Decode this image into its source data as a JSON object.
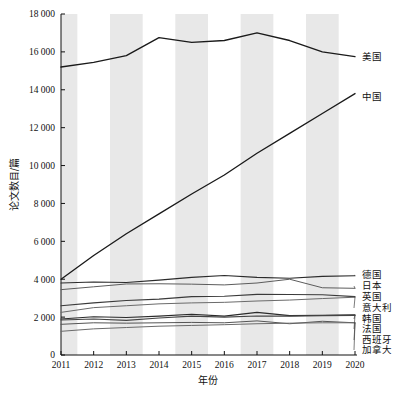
{
  "chart_data": {
    "type": "line",
    "title": "",
    "xlabel": "年份",
    "ylabel": "论文数目/篇",
    "x": [
      2011,
      2012,
      2013,
      2014,
      2015,
      2016,
      2017,
      2018,
      2019,
      2020
    ],
    "xtick_labels": [
      "2011",
      "2012",
      "2013",
      "2014",
      "2015",
      "2016",
      "2017",
      "2018",
      "2019",
      "2020"
    ],
    "ytick_labels": [
      "0",
      "2 000",
      "4 000",
      "6 000",
      "8 000",
      "10 000",
      "12 000",
      "14 000",
      "16 000",
      "18 000"
    ],
    "ytick_values": [
      0,
      2000,
      4000,
      6000,
      8000,
      10000,
      12000,
      14000,
      16000,
      18000
    ],
    "ylim": [
      0,
      18000
    ],
    "xlim": [
      2011,
      2020
    ],
    "grid": false,
    "legend_position": "right-inline",
    "shaded_bands": [
      2011,
      2013,
      2015,
      2017,
      2019
    ],
    "series": [
      {
        "name": "美国",
        "color": "#1a1a1a",
        "width": 1.35,
        "values": [
          15200,
          15450,
          15800,
          16750,
          16500,
          16600,
          17000,
          16600,
          16000,
          15750
        ]
      },
      {
        "name": "中国",
        "color": "#1a1a1a",
        "width": 1.35,
        "values": [
          4000,
          5250,
          6400,
          7450,
          8500,
          9500,
          10650,
          11700,
          12750,
          13800
        ]
      },
      {
        "name": "德国",
        "color": "#2b2b2b",
        "width": 1.1,
        "values": [
          3800,
          3850,
          3830,
          3950,
          4100,
          4200,
          4100,
          4050,
          4150,
          4180
        ]
      },
      {
        "name": "日本",
        "color": "#5c5c5c",
        "width": 1.0,
        "values": [
          3450,
          3600,
          3750,
          3760,
          3740,
          3700,
          3800,
          4000,
          3550,
          3520
        ]
      },
      {
        "name": "英国",
        "color": "#3a3a3a",
        "width": 1.1,
        "values": [
          2600,
          2750,
          2880,
          2950,
          3080,
          3100,
          3200,
          3190,
          3180,
          3080
        ]
      },
      {
        "name": "意大利",
        "color": "#6b6b6b",
        "width": 1.0,
        "values": [
          2250,
          2500,
          2600,
          2700,
          2750,
          2780,
          2850,
          2900,
          2980,
          3050
        ]
      },
      {
        "name": "韩国",
        "color": "#2b2b2b",
        "width": 1.1,
        "values": [
          1900,
          2020,
          1980,
          2050,
          2150,
          2050,
          2250,
          2080,
          2100,
          2120
        ]
      },
      {
        "name": "法国",
        "color": "#444444",
        "width": 1.1,
        "values": [
          1850,
          1900,
          1830,
          1950,
          2050,
          2000,
          2060,
          2050,
          2080,
          2090
        ]
      },
      {
        "name": "西班牙",
        "color": "#555555",
        "width": 1.0,
        "values": [
          1620,
          1700,
          1680,
          1700,
          1720,
          1700,
          1800,
          1650,
          1780,
          1700
        ]
      },
      {
        "name": "加拿大",
        "color": "#6b6b6b",
        "width": 1.0,
        "values": [
          1250,
          1380,
          1450,
          1520,
          1560,
          1600,
          1650,
          1680,
          1700,
          1700
        ]
      }
    ],
    "annotations": [
      {
        "label": "美国",
        "anchor_x": 2020,
        "anchor_y": 15750
      },
      {
        "label": "中国",
        "anchor_x": 2020,
        "anchor_y": 13800
      },
      {
        "label": "德国",
        "anchor_x": 2020,
        "anchor_y": 4180
      },
      {
        "label": "日本",
        "anchor_x": 2020,
        "anchor_y": 3520
      },
      {
        "label": "英国",
        "anchor_x": 2020,
        "anchor_y": 3080
      },
      {
        "label": "意大利",
        "anchor_x": 2020,
        "anchor_y": 3050
      },
      {
        "label": "韩国",
        "anchor_x": 2020,
        "anchor_y": 2120
      },
      {
        "label": "法国",
        "anchor_x": 2020,
        "anchor_y": 2090
      },
      {
        "label": "西班牙",
        "anchor_x": 2020,
        "anchor_y": 1700
      },
      {
        "label": "加拿大",
        "anchor_x": 2020,
        "anchor_y": 1700
      }
    ]
  }
}
